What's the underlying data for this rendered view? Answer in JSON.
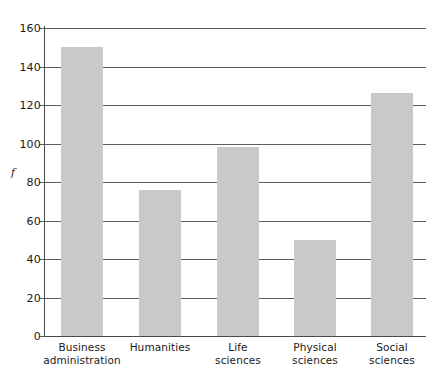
{
  "chart_data": {
    "type": "bar",
    "title": "",
    "subtitle": "",
    "xlabel": "",
    "ylabel": "f",
    "ylim": [
      0,
      160
    ],
    "ytick_step": 20,
    "grid": true,
    "legend": false,
    "categories": [
      "Business administration",
      "Humanities",
      "Life sciences",
      "Physical sciences",
      "Social sciences"
    ],
    "category_lines": [
      [
        "Business",
        "administration"
      ],
      [
        "Humanities",
        ""
      ],
      [
        "Life",
        "sciences"
      ],
      [
        "Physical",
        "sciences"
      ],
      [
        "Social",
        "sciences"
      ]
    ],
    "values": [
      150,
      76,
      98,
      50,
      126
    ],
    "ytick_labels": [
      "0",
      "20",
      "40",
      "60",
      "80",
      "100",
      "120",
      "140",
      "160"
    ],
    "ytick_values": [
      0,
      20,
      40,
      60,
      80,
      100,
      120,
      140,
      160
    ],
    "colors": {
      "bar_fill": "#c9c9c9",
      "gridline": "#5e5e5e",
      "axis": "#4a4a4a",
      "text": "#1a1a1a",
      "background": "#ffffff"
    }
  }
}
